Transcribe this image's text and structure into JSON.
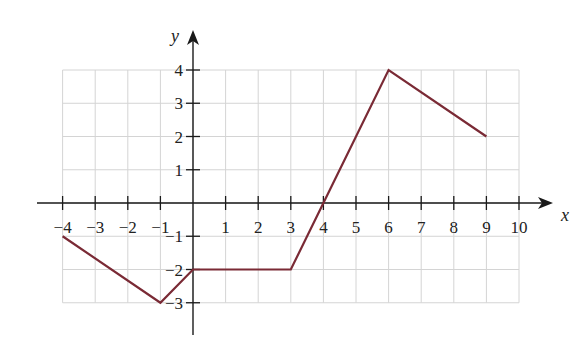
{
  "chart_data": {
    "type": "line",
    "title": "",
    "xlabel": "x",
    "ylabel": "y",
    "xlim": [
      -4,
      10
    ],
    "ylim": [
      -3,
      4
    ],
    "grid": true,
    "x_ticks": [
      -4,
      -3,
      -2,
      -1,
      1,
      2,
      3,
      4,
      5,
      6,
      7,
      8,
      9,
      10
    ],
    "y_ticks": [
      -3,
      -2,
      -1,
      1,
      2,
      3,
      4
    ],
    "x_tick_labels": [
      "−4",
      "−3",
      "−2",
      "−1",
      "1",
      "2",
      "3",
      "4",
      "5",
      "6",
      "7",
      "8",
      "9",
      "10"
    ],
    "y_tick_labels": [
      "−3",
      "−2",
      "−1",
      "1",
      "2",
      "3",
      "4"
    ],
    "series": [
      {
        "name": "f(x)",
        "color": "#7a2a35",
        "points": [
          {
            "x": -4,
            "y": -1
          },
          {
            "x": -1,
            "y": -3
          },
          {
            "x": 0,
            "y": -2
          },
          {
            "x": 3,
            "y": -2
          },
          {
            "x": 4,
            "y": 0
          },
          {
            "x": 6,
            "y": 4
          },
          {
            "x": 9,
            "y": 2
          }
        ]
      }
    ]
  },
  "layout": {
    "origin_px": [
      193,
      203
    ],
    "unit_px_x": 32.6,
    "unit_px_y": 33.25,
    "grid_x_range": [
      -4,
      10
    ],
    "grid_y_range": [
      -3,
      4
    ],
    "x_axis_px": [
      37,
      553
    ],
    "y_axis_px": [
      335,
      30
    ],
    "colors": {
      "grid": "#d4d4d4",
      "axis": "#1a1a1a",
      "line": "#7a2a35"
    }
  }
}
